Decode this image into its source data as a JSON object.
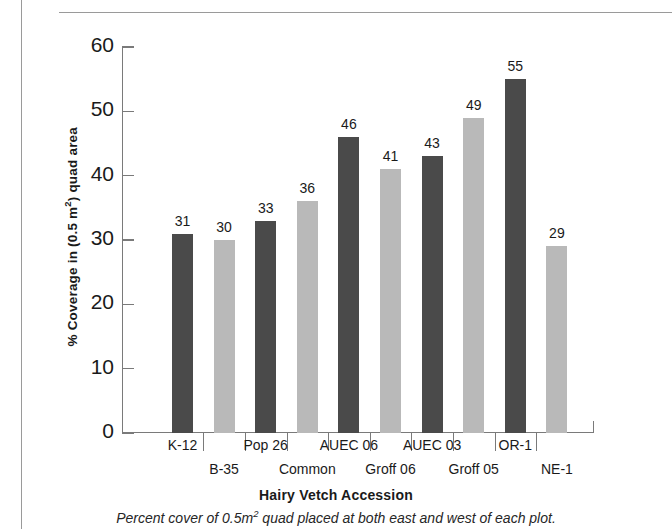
{
  "chart_data": {
    "type": "bar",
    "title": "",
    "xlabel": "Hairy Vetch Accession",
    "ylabel": "% Coverage in (0.5 m2) quad area",
    "ylabel_prefix": "% Coverage in (0.5 m",
    "ylabel_sup": "2",
    "ylabel_suffix": ") quad area",
    "categories": [
      "K-12",
      "B-35",
      "Pop 26",
      "Common",
      "AUEC 06",
      "Groff 06",
      "AUEC 03",
      "Groff 05",
      "OR-1",
      "NE-1"
    ],
    "values": [
      31,
      30,
      33,
      36,
      46,
      41,
      43,
      49,
      55,
      29
    ],
    "value_labels": [
      "31",
      "30",
      "33",
      "36",
      "46",
      "41",
      "43",
      "49",
      "55",
      "29"
    ],
    "bar_colors": [
      "#4a4a4a",
      "#b9b9b9",
      "#4a4a4a",
      "#b9b9b9",
      "#4a4a4a",
      "#b9b9b9",
      "#4a4a4a",
      "#b9b9b9",
      "#4a4a4a",
      "#b9b9b9"
    ],
    "ylim": [
      0,
      60
    ],
    "yticks": [
      0,
      10,
      20,
      30,
      40,
      50,
      60
    ],
    "ytick_labels": [
      "0",
      "10",
      "20",
      "30",
      "40",
      "50",
      "60"
    ],
    "grid": false,
    "legend": "none",
    "dark_color": "#4a4a4a",
    "light_color": "#b9b9b9",
    "axis_color": "#7a7a7a"
  },
  "caption": {
    "prefix": "Percent cover of 0.5m",
    "sup": "2",
    "suffix": " quad placed at both east and west of each plot."
  }
}
